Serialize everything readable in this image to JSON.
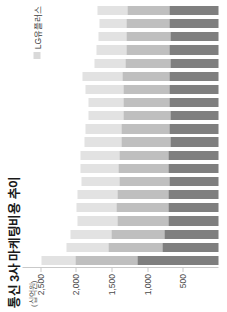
{
  "chart_data": {
    "type": "bar",
    "subtype": "stacked-column",
    "title": "통신 3사 마케팅비용 추이",
    "unit_label": "(십억원)",
    "xlabel": "",
    "ylabel": "",
    "ylim": [
      0,
      2750
    ],
    "grid": false,
    "legend_position": "top-right",
    "ytick_labels": [
      "2,500",
      "2,000",
      "1,500",
      "1,000",
      "500"
    ],
    "ytick_values": [
      2500,
      2000,
      1500,
      1000,
      500
    ],
    "legend": [
      {
        "name": "LG유플러스",
        "color": "#d9d9d9"
      }
    ],
    "series": [
      {
        "name": "series-dark",
        "color": "#7f7f7f",
        "values": [
          1130,
          790,
          760,
          700,
          700,
          700,
          690,
          700,
          700,
          680,
          690,
          670,
          690,
          690,
          690,
          680,
          690,
          680,
          690,
          690
        ]
      },
      {
        "name": "series-mid",
        "color": "#bfbfbf",
        "values": [
          880,
          760,
          740,
          720,
          730,
          720,
          700,
          700,
          690,
          680,
          670,
          660,
          650,
          650,
          660,
          620,
          600,
          610,
          600,
          590
        ]
      },
      {
        "name": "series-light",
        "color": "#e2e2e2",
        "values": [
          480,
          590,
          580,
          560,
          560,
          560,
          530,
          540,
          540,
          520,
          500,
          490,
          480,
          520,
          560,
          440,
          420,
          400,
          380,
          420
        ]
      }
    ],
    "categories": [
      "c1",
      "c2",
      "c3",
      "c4",
      "c5",
      "c6",
      "c7",
      "c8",
      "c9",
      "c10",
      "c11",
      "c12",
      "c13",
      "c14",
      "c15",
      "c16",
      "c17",
      "c18",
      "c19",
      "c20"
    ]
  }
}
